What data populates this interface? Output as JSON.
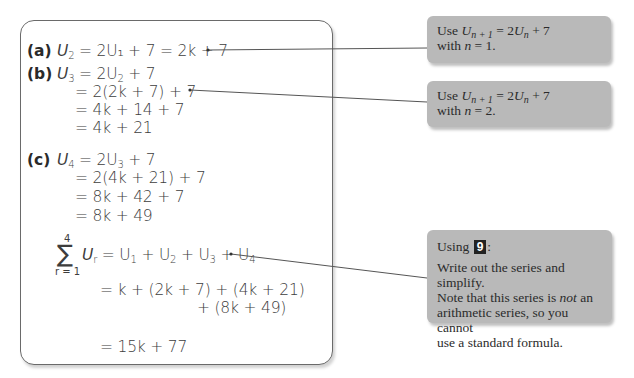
{
  "solution": {
    "part_a": {
      "label": "(a)",
      "lines": [
        "= 2U₁ + 7 = 2k + 7"
      ],
      "lhs": "U",
      "lhs_sub": "2"
    },
    "part_b": {
      "label": "(b)",
      "first": {
        "lhs": "U",
        "lhs_sub": "3",
        "rhs": "= 2U",
        "rhs_sub": "2",
        "rhs_tail": " + 7"
      },
      "lines": [
        "= 2(2k + 7) + 7",
        "= 4k + 14 + 7",
        "= 4k + 21"
      ]
    },
    "part_c": {
      "label": "(c)",
      "first": {
        "lhs": "U",
        "lhs_sub": "4",
        "rhs": "= 2U",
        "rhs_sub": "3",
        "rhs_tail": " + 7"
      },
      "lines": [
        "= 2(4k + 21) + 7",
        "= 8k + 42 + 7",
        "= 8k + 49"
      ]
    },
    "sum": {
      "sigma": "∑",
      "upper": "4",
      "lower": "r = 1",
      "term": "U",
      "term_sub": "r",
      "expansion": [
        "= U",
        "1",
        " + U",
        "2",
        " + U",
        "3",
        " + U",
        "4"
      ],
      "line2": "= k + (2k + 7) + (4k + 21)",
      "line3": "+ (8k + 49)",
      "result": "= 15k + 77"
    }
  },
  "notes": [
    {
      "line1_prefix": "Use ",
      "line1_var": "U",
      "line1_sub": "n + 1",
      "line1_mid": " = 2",
      "line1_var2": "U",
      "line1_sub2": "n",
      "line1_tail": " + 7",
      "line2_prefix": "with ",
      "line2_var": "n",
      "line2_tail": " = 1."
    },
    {
      "line1_prefix": "Use ",
      "line1_var": "U",
      "line1_sub": "n + 1",
      "line1_mid": " = 2",
      "line1_var2": "U",
      "line1_sub2": "n",
      "line1_tail": " + 7",
      "line2_prefix": "with ",
      "line2_var": "n",
      "line2_tail": " = 2."
    },
    {
      "heading_prefix": "Using ",
      "heading_tag": "9",
      "heading_suffix": ":",
      "body_1": "Write out the series and simplify.",
      "body_2_prefix": "Note that this series is ",
      "body_2_em": "not",
      "body_2_suffix": " an",
      "body_3": "arithmetic series, so you cannot",
      "body_4": "use a standard formula."
    }
  ],
  "colors": {
    "note_fill": "#b9b9b9",
    "border": "#6a6a6a",
    "tag_fill": "#222222"
  }
}
